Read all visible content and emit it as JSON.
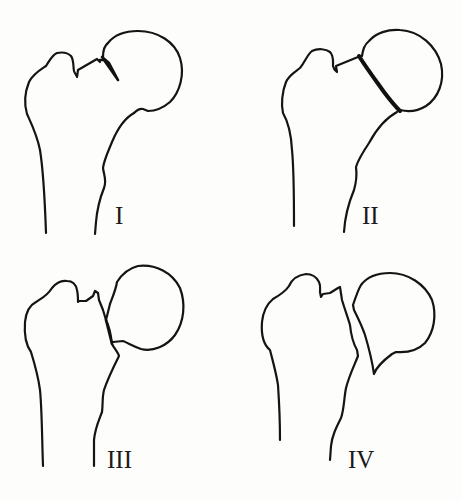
{
  "figure": {
    "panels": [
      {
        "id": "I",
        "label": "I",
        "description": "Incomplete / valgus impacted fracture"
      },
      {
        "id": "II",
        "label": "II",
        "description": "Complete fracture, non-displaced"
      },
      {
        "id": "III",
        "label": "III",
        "description": "Complete fracture, partially displaced"
      },
      {
        "id": "IV",
        "label": "IV",
        "description": "Complete fracture, fully displaced"
      }
    ],
    "colors": {
      "ink": "#141414",
      "background": "#fdfdfc"
    }
  }
}
